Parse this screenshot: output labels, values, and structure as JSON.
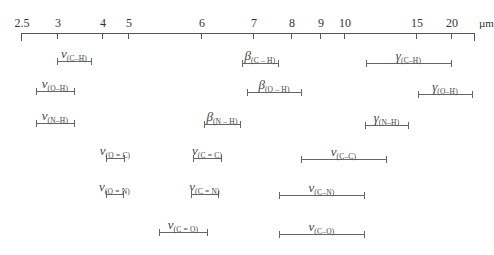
{
  "diagram": {
    "unit": "µm",
    "axis": {
      "y": 33,
      "x_start": 21,
      "x_end": 474,
      "ticks": [
        {
          "label": "2.5",
          "x": 21
        },
        {
          "label": "3",
          "x": 57
        },
        {
          "label": "4",
          "x": 102
        },
        {
          "label": "5",
          "x": 128
        },
        {
          "label": "6",
          "x": 201
        },
        {
          "label": "7",
          "x": 253
        },
        {
          "label": "8",
          "x": 291
        },
        {
          "label": "9",
          "x": 320
        },
        {
          "label": "10",
          "x": 344
        },
        {
          "label": "15",
          "x": 416
        },
        {
          "label": "20",
          "x": 451
        },
        {
          "label": "",
          "x": 474
        }
      ]
    },
    "bands": [
      {
        "symbol": "ν",
        "group": "(C–H)",
        "x1": 57,
        "x2": 91,
        "y": 61,
        "range_um": [
          3.0,
          3.7
        ]
      },
      {
        "symbol": "β",
        "group": "(C – H)",
        "x1": 242,
        "x2": 278,
        "y": 63,
        "range_um": [
          6.8,
          7.7
        ]
      },
      {
        "symbol": "γ",
        "group": "(C–H)",
        "x1": 366,
        "x2": 451,
        "y": 63,
        "range_um": [
          11.5,
          20
        ]
      },
      {
        "symbol": "ν",
        "group": "(O–H)",
        "x1": 36,
        "x2": 74,
        "y": 91,
        "range_um": [
          2.7,
          3.3
        ]
      },
      {
        "symbol": "β",
        "group": "(O – H)",
        "x1": 247,
        "x2": 301,
        "y": 92,
        "range_um": [
          6.9,
          8.3
        ]
      },
      {
        "symbol": "γ",
        "group": "(O–H)",
        "x1": 418,
        "x2": 472,
        "y": 94,
        "range_um": [
          15.2,
          25
        ]
      },
      {
        "symbol": "ν",
        "group": "(N–H)",
        "x1": 36,
        "x2": 74,
        "y": 123,
        "range_um": [
          2.7,
          3.3
        ]
      },
      {
        "symbol": "β",
        "group": "(N – H)",
        "x1": 204,
        "x2": 240,
        "y": 124,
        "range_um": [
          6.1,
          6.8
        ]
      },
      {
        "symbol": "γ",
        "group": "(N–H)",
        "x1": 365,
        "x2": 408,
        "y": 125,
        "range_um": [
          11.4,
          14.5
        ]
      },
      {
        "symbol": "ν",
        "group": "(O = C)",
        "x1": 106,
        "x2": 124,
        "y": 158,
        "range_um": [
          4.1,
          4.4
        ]
      },
      {
        "symbol": "ν",
        "group": "(C = C)",
        "x1": 193,
        "x2": 221,
        "y": 158,
        "range_um": [
          5.9,
          6.4
        ]
      },
      {
        "symbol": "ν",
        "group": "(C–C)",
        "x1": 301,
        "x2": 386,
        "y": 159,
        "range_um": [
          8.3,
          13
        ]
      },
      {
        "symbol": "ν",
        "group": "(O = N)",
        "x1": 106,
        "x2": 123,
        "y": 194,
        "range_um": [
          4.1,
          4.4
        ]
      },
      {
        "symbol": "ν",
        "group": "(C = N)",
        "x1": 191,
        "x2": 218,
        "y": 194,
        "range_um": [
          5.9,
          6.3
        ]
      },
      {
        "symbol": "ν",
        "group": "(C–N)",
        "x1": 279,
        "x2": 364,
        "y": 195,
        "range_um": [
          7.7,
          11.4
        ]
      },
      {
        "symbol": "ν",
        "group": "(C = O)",
        "x1": 159,
        "x2": 207,
        "y": 232,
        "range_um": [
          5.4,
          6.1
        ]
      },
      {
        "symbol": "ν",
        "group": "(C–O)",
        "x1": 279,
        "x2": 364,
        "y": 234,
        "range_um": [
          7.7,
          11.4
        ]
      }
    ]
  }
}
